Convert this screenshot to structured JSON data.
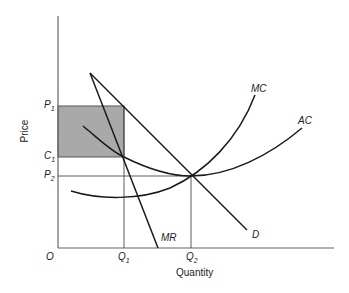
{
  "diagram": {
    "type": "monopoly-profit-maximization",
    "axes": {
      "x_title": "Quantity",
      "y_title": "Price",
      "origin_label": "O"
    },
    "x_ticks": [
      {
        "letter": "Q",
        "sub": "1"
      },
      {
        "letter": "Q",
        "sub": "2"
      }
    ],
    "y_ticks": [
      {
        "letter": "P",
        "sub": "1"
      },
      {
        "letter": "C",
        "sub": "1"
      },
      {
        "letter": "P",
        "sub": "2"
      }
    ],
    "curves": {
      "mc": "MC",
      "ac": "AC",
      "mr": "MR",
      "d": "D"
    },
    "colors": {
      "line": "#1a1a1a",
      "axis": "#555555",
      "profit_area": "#a9a9a9"
    }
  }
}
